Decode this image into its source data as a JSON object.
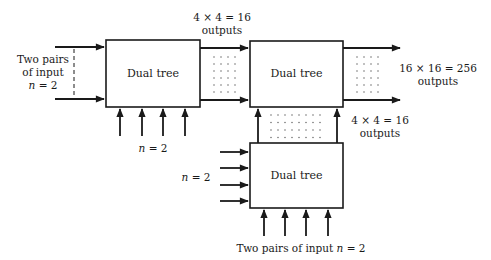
{
  "diagram": {
    "title": "",
    "colors": {
      "stroke": "#1a1a1a",
      "background": "#ffffff",
      "dots": "#555555"
    },
    "nodes": [
      {
        "id": "tree1",
        "label": "Dual tree",
        "x": 106,
        "y": 40,
        "w": 94,
        "h": 67
      },
      {
        "id": "tree2",
        "label": "Dual tree",
        "x": 250,
        "y": 41,
        "w": 93,
        "h": 66
      },
      {
        "id": "tree3",
        "label": "Dual tree",
        "x": 250,
        "y": 143,
        "w": 93,
        "h": 65
      }
    ],
    "edges": [
      {
        "from": "input-left",
        "to": "tree1",
        "count": 2
      },
      {
        "from": "input-bottom",
        "to": "tree1",
        "count": 4
      },
      {
        "from": "tree1",
        "to": "tree2",
        "count": 2,
        "bundle": "4 x 4 = 16 outputs"
      },
      {
        "from": "tree3",
        "to": "tree2",
        "count": 2,
        "bundle": "4 x 4 = 16 outputs"
      },
      {
        "from": "input-left",
        "to": "tree3",
        "count": 4
      },
      {
        "from": "input-bottom",
        "to": "tree3",
        "count": 4
      },
      {
        "from": "tree2",
        "to": "output",
        "count": 2,
        "bundle": "16 x 16 = 256 outputs"
      }
    ],
    "labels": {
      "left_input": {
        "line1": "Two pairs",
        "line2": "of input",
        "line3_var": "n",
        "line3_rest": " = 2"
      },
      "tree1_bottom": {
        "var": "n",
        "rest": " = 2"
      },
      "top_bundle": {
        "line1": "4 × 4 = 16",
        "line2": "outputs"
      },
      "final_output": {
        "line1": "16 × 16 = 256",
        "line2": "outputs"
      },
      "vertical_bundle": {
        "line1": "4 × 4 = 16",
        "line2": "outputs"
      },
      "tree3_left": {
        "var": "n",
        "rest": " = 2"
      },
      "tree3_bottom": {
        "prefix": "Two pairs of input ",
        "var": "n",
        "rest": " = 2"
      }
    }
  }
}
